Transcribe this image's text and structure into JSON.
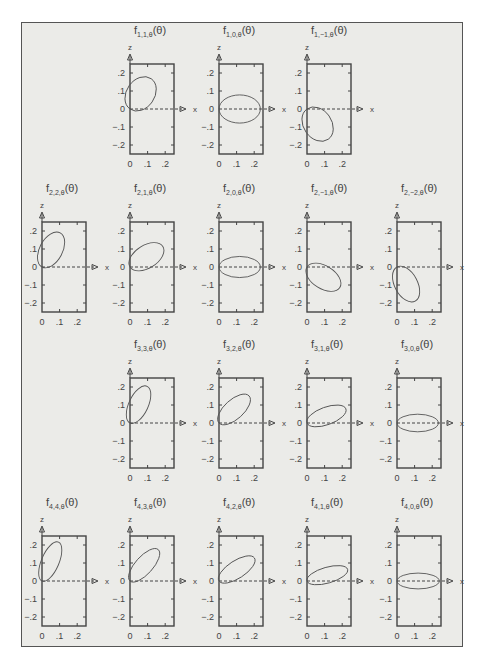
{
  "figure": {
    "axis_labels": {
      "x": "x",
      "z": "z"
    },
    "x_ticks": [
      "0",
      ".1",
      ".2"
    ],
    "z_ticks": [
      ".2",
      ".1",
      "0",
      "−.1",
      "−.2"
    ],
    "title_prefix": "f",
    "title_suffix": "(θ)",
    "colors": {
      "background": "#ebebe8",
      "ink": "#444444",
      "curve": "#555555",
      "frame": "#555555"
    }
  },
  "chart_data": {
    "type": "polar-lobes",
    "title": "",
    "xlabel": "x",
    "ylabel": "z",
    "xlim": [
      0,
      0.25
    ],
    "ylim": [
      -0.25,
      0.25
    ],
    "grid": false,
    "panels": [
      {
        "row": 1,
        "col": 2,
        "l": 1,
        "m": 1,
        "label": "1,1,θ",
        "lobe_angle_deg": 55,
        "lobe_length": 0.21,
        "lobe_width": 0.08
      },
      {
        "row": 1,
        "col": 3,
        "l": 1,
        "m": 0,
        "label": "1,0,θ",
        "lobe_angle_deg": 0,
        "lobe_length": 0.235,
        "lobe_width": 0.08
      },
      {
        "row": 1,
        "col": 4,
        "l": 1,
        "m": -1,
        "label": "1,−1,θ",
        "lobe_angle_deg": -55,
        "lobe_length": 0.21,
        "lobe_width": 0.08
      },
      {
        "row": 2,
        "col": 1,
        "l": 2,
        "m": 2,
        "label": "2,2,θ",
        "lobe_angle_deg": 62,
        "lobe_length": 0.22,
        "lobe_width": 0.065
      },
      {
        "row": 2,
        "col": 2,
        "l": 2,
        "m": 1,
        "label": "2,1,θ",
        "lobe_angle_deg": 32,
        "lobe_length": 0.22,
        "lobe_width": 0.065
      },
      {
        "row": 2,
        "col": 3,
        "l": 2,
        "m": 0,
        "label": "2,0,θ",
        "lobe_angle_deg": 0,
        "lobe_length": 0.235,
        "lobe_width": 0.06
      },
      {
        "row": 2,
        "col": 4,
        "l": 2,
        "m": -1,
        "label": "2,−1,θ",
        "lobe_angle_deg": -32,
        "lobe_length": 0.22,
        "lobe_width": 0.065
      },
      {
        "row": 2,
        "col": 5,
        "l": 2,
        "m": -2,
        "label": "2,−2,θ",
        "lobe_angle_deg": -62,
        "lobe_length": 0.22,
        "lobe_width": 0.065
      },
      {
        "row": 3,
        "col": 2,
        "l": 3,
        "m": 3,
        "label": "3,3,θ",
        "lobe_angle_deg": 65,
        "lobe_length": 0.23,
        "lobe_width": 0.055
      },
      {
        "row": 3,
        "col": 3,
        "l": 3,
        "m": 2,
        "label": "3,2,θ",
        "lobe_angle_deg": 42,
        "lobe_length": 0.23,
        "lobe_width": 0.055
      },
      {
        "row": 3,
        "col": 4,
        "l": 3,
        "m": 1,
        "label": "3,1,θ",
        "lobe_angle_deg": 20,
        "lobe_length": 0.235,
        "lobe_width": 0.05
      },
      {
        "row": 3,
        "col": 5,
        "l": 3,
        "m": 0,
        "label": "3,0,θ",
        "lobe_angle_deg": 0,
        "lobe_length": 0.235,
        "lobe_width": 0.05
      },
      {
        "row": 4,
        "col": 1,
        "l": 4,
        "m": 4,
        "label": "4,4,θ",
        "lobe_angle_deg": 67,
        "lobe_length": 0.24,
        "lobe_width": 0.05
      },
      {
        "row": 4,
        "col": 2,
        "l": 4,
        "m": 3,
        "label": "4,3,θ",
        "lobe_angle_deg": 48,
        "lobe_length": 0.24,
        "lobe_width": 0.05
      },
      {
        "row": 4,
        "col": 3,
        "l": 4,
        "m": 2,
        "label": "4,2,θ",
        "lobe_angle_deg": 33,
        "lobe_length": 0.24,
        "lobe_width": 0.05
      },
      {
        "row": 4,
        "col": 4,
        "l": 4,
        "m": 1,
        "label": "4,1,θ",
        "lobe_angle_deg": 16,
        "lobe_length": 0.24,
        "lobe_width": 0.045
      },
      {
        "row": 4,
        "col": 5,
        "l": 4,
        "m": 0,
        "label": "4,0,θ",
        "lobe_angle_deg": 0,
        "lobe_length": 0.24,
        "lobe_width": 0.045
      }
    ]
  }
}
